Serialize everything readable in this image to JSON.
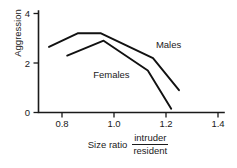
{
  "chart_data": {
    "type": "line",
    "title": "",
    "subtitle": "",
    "xlabel": "Size ratio intruder/resident",
    "xlabel_lead": "Size ratio",
    "xlabel_numerator": "intruder",
    "xlabel_denominator": "resident",
    "ylabel": "Aggression",
    "xlim": [
      0.7,
      1.4
    ],
    "ylim": [
      0,
      4
    ],
    "xticks": [
      0.8,
      1.0,
      1.2,
      1.4
    ],
    "xtick_labels": [
      "0.8",
      "1.0",
      "1.2",
      "1.4"
    ],
    "yticks": [
      0,
      2,
      4
    ],
    "ytick_labels": [
      "0",
      "2",
      "4"
    ],
    "grid": false,
    "legend_position": "inline-annotations",
    "annotations": [
      {
        "text": "Males",
        "x": 1.21,
        "y": 2.62
      },
      {
        "text": "Females",
        "x": 0.99,
        "y": 1.38
      }
    ],
    "series": [
      {
        "name": "Males",
        "color": "#111111",
        "x": [
          0.75,
          0.86,
          0.95,
          1.15,
          1.25
        ],
        "values": [
          2.65,
          3.2,
          3.2,
          2.2,
          0.9
        ]
      },
      {
        "name": "Females",
        "color": "#111111",
        "x": [
          0.82,
          0.96,
          1.13,
          1.22
        ],
        "values": [
          2.3,
          2.9,
          1.7,
          0.15
        ]
      }
    ]
  },
  "axes": {
    "y_label": "Aggression",
    "x_tick_0": "0.8",
    "x_tick_1": "1.0",
    "x_tick_2": "1.2",
    "x_tick_3": "1.4",
    "y_tick_0": "0",
    "y_tick_1": "2",
    "y_tick_2": "4"
  },
  "labels": {
    "males": "Males",
    "females": "Females",
    "size_ratio": "Size ratio",
    "intruder": "intruder",
    "resident": "resident"
  }
}
